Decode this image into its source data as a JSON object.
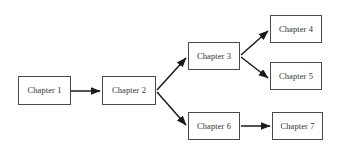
{
  "diagram": {
    "type": "flowchart",
    "background_color": "#ffffff",
    "node_border_color": "#4a4a4a",
    "node_fill_color": "#ffffff",
    "text_color": "#333333",
    "edge_color": "#1a1a1a",
    "nodes": [
      {
        "id": "ch1",
        "label": "Chapter 1",
        "x": 18,
        "y": 76,
        "w": 53,
        "h": 29
      },
      {
        "id": "ch2",
        "label": "Chapter 2",
        "x": 102,
        "y": 76,
        "w": 54,
        "h": 29
      },
      {
        "id": "ch3",
        "label": "Chapter 3",
        "x": 188,
        "y": 42,
        "w": 52,
        "h": 28
      },
      {
        "id": "ch4",
        "label": "Chapter 4",
        "x": 270,
        "y": 15,
        "w": 52,
        "h": 28
      },
      {
        "id": "ch5",
        "label": "Chapter 5",
        "x": 270,
        "y": 62,
        "w": 52,
        "h": 28
      },
      {
        "id": "ch6",
        "label": "Chapter 6",
        "x": 188,
        "y": 112,
        "w": 52,
        "h": 28
      },
      {
        "id": "ch7",
        "label": "Chapter 7",
        "x": 272,
        "y": 112,
        "w": 51,
        "h": 28
      }
    ],
    "edges": [
      {
        "from": "ch1",
        "to": "ch2",
        "x1": 71,
        "y1": 91,
        "x2": 100,
        "y2": 91
      },
      {
        "from": "ch2",
        "to": "ch3",
        "x1": 157,
        "y1": 90,
        "x2": 186,
        "y2": 58
      },
      {
        "from": "ch2",
        "to": "ch6",
        "x1": 157,
        "y1": 92,
        "x2": 186,
        "y2": 125
      },
      {
        "from": "ch3",
        "to": "ch4",
        "x1": 241,
        "y1": 55,
        "x2": 268,
        "y2": 31
      },
      {
        "from": "ch3",
        "to": "ch5",
        "x1": 241,
        "y1": 57,
        "x2": 268,
        "y2": 78
      },
      {
        "from": "ch6",
        "to": "ch7",
        "x1": 241,
        "y1": 126,
        "x2": 270,
        "y2": 126
      }
    ]
  }
}
